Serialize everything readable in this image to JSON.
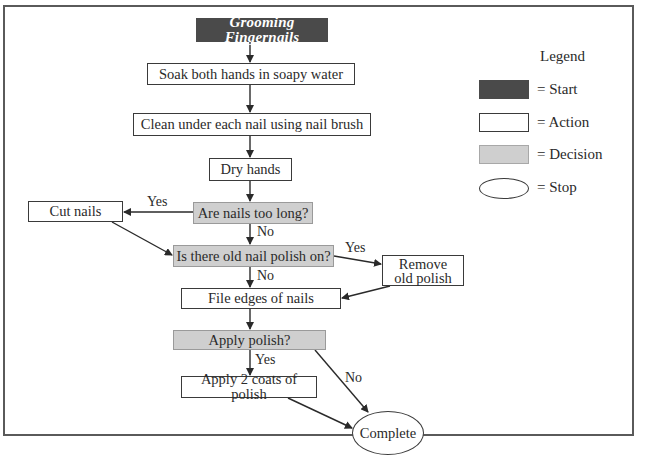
{
  "diagram": {
    "title": "Grooming Fingernails",
    "nodes": {
      "start": {
        "type": "start",
        "label": "Grooming Fingernails"
      },
      "soak": {
        "type": "action",
        "label": "Soak both hands in soapy water"
      },
      "clean": {
        "type": "action",
        "label": "Clean under each nail using nail brush"
      },
      "dry": {
        "type": "action",
        "label": "Dry hands"
      },
      "too_long": {
        "type": "decision",
        "label": "Are nails too long?"
      },
      "cut": {
        "type": "action",
        "label": "Cut nails"
      },
      "old_polish": {
        "type": "decision",
        "label": "Is there old nail polish on?"
      },
      "remove": {
        "type": "action",
        "label": "Remove old polish"
      },
      "file": {
        "type": "action",
        "label": "File edges of nails"
      },
      "apply_q": {
        "type": "decision",
        "label": "Apply polish?"
      },
      "apply_coats": {
        "type": "action",
        "label": "Apply 2 coats of polish"
      },
      "complete": {
        "type": "stop",
        "label": "Complete"
      }
    },
    "edges": [
      {
        "from": "start",
        "to": "soak",
        "label": ""
      },
      {
        "from": "soak",
        "to": "clean",
        "label": ""
      },
      {
        "from": "clean",
        "to": "dry",
        "label": ""
      },
      {
        "from": "dry",
        "to": "too_long",
        "label": ""
      },
      {
        "from": "too_long",
        "to": "cut",
        "label": "Yes"
      },
      {
        "from": "too_long",
        "to": "old_polish",
        "label": "No"
      },
      {
        "from": "cut",
        "to": "old_polish",
        "label": ""
      },
      {
        "from": "old_polish",
        "to": "remove",
        "label": "Yes"
      },
      {
        "from": "old_polish",
        "to": "file",
        "label": "No"
      },
      {
        "from": "remove",
        "to": "file",
        "label": ""
      },
      {
        "from": "file",
        "to": "apply_q",
        "label": ""
      },
      {
        "from": "apply_q",
        "to": "apply_coats",
        "label": "Yes"
      },
      {
        "from": "apply_q",
        "to": "complete",
        "label": "No"
      },
      {
        "from": "apply_coats",
        "to": "complete",
        "label": ""
      }
    ],
    "edge_labels": {
      "too_long_yes": "Yes",
      "too_long_no": "No",
      "old_polish_yes": "Yes",
      "old_polish_no": "No",
      "apply_yes": "Yes",
      "apply_no": "No"
    }
  },
  "legend": {
    "title": "Legend",
    "items": [
      {
        "shape": "filled-dark-rect",
        "label": "= Start",
        "color": "#4a4a4a"
      },
      {
        "shape": "white-rect",
        "label": "= Action",
        "color": "#ffffff"
      },
      {
        "shape": "gray-rect",
        "label": "= Decision",
        "color": "#cfcfcf"
      },
      {
        "shape": "ellipse",
        "label": "= Stop",
        "color": "#ffffff"
      }
    ]
  },
  "colors": {
    "start_fill": "#4a4a4a",
    "decision_fill": "#cfcfcf",
    "line": "#2a2a2a"
  }
}
